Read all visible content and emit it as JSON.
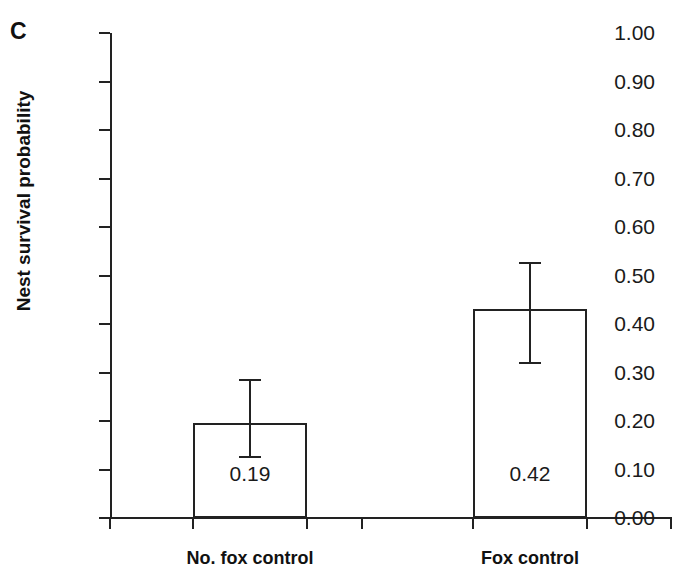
{
  "panel": {
    "letter": "C"
  },
  "chart_data": {
    "type": "bar",
    "title": "",
    "xlabel": "",
    "ylabel": "Nest survival probability",
    "categories": [
      "No. fox control",
      "Fox control"
    ],
    "values": [
      0.195,
      0.43
    ],
    "value_labels": [
      "0.19",
      "0.42"
    ],
    "errors_low": [
      0.125,
      0.32
    ],
    "errors_high": [
      0.285,
      0.525
    ],
    "ylim": [
      0.0,
      1.0
    ],
    "ytick_labels": [
      "1.00",
      "0.90",
      "0.80",
      "0.70",
      "0.60",
      "0.50",
      "0.40",
      "0.30",
      "0.20",
      "0.10",
      "0.00"
    ],
    "ytick_values": [
      1.0,
      0.9,
      0.8,
      0.7,
      0.6,
      0.5,
      0.4,
      0.3,
      0.2,
      0.1,
      0.0
    ],
    "grid": false,
    "legend": null,
    "bar_fill_color": "#ffffff",
    "bar_edge_color": "#222222",
    "axis_color": "#222222",
    "text_color": "#1a1a1a"
  }
}
